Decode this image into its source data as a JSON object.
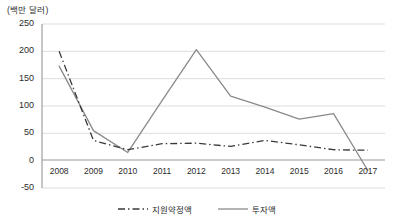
{
  "chart_data": {
    "type": "line",
    "title": "",
    "subtitle": "",
    "unit_label": "(백만 달러)",
    "xlabel": "",
    "ylabel": "",
    "categories": [
      "2008",
      "2009",
      "2010",
      "2011",
      "2012",
      "2013",
      "2014",
      "2015",
      "2016",
      "2017"
    ],
    "x": [
      2008,
      2009,
      2010,
      2011,
      2012,
      2013,
      2014,
      2015,
      2016,
      2017
    ],
    "ylim": [
      -50,
      250
    ],
    "yticks": [
      250,
      200,
      150,
      100,
      50,
      0,
      -50
    ],
    "ytick_labels": [
      "250",
      "200",
      "150",
      "100",
      "50",
      "0",
      "-50"
    ],
    "grid": true,
    "grid_axis": "y",
    "legend_position": "bottom",
    "series": [
      {
        "name": "지원약정액",
        "style": "dash-dot",
        "color": "#3a3a3a",
        "values": [
          200,
          37,
          20,
          31,
          32,
          26,
          37,
          29,
          20,
          19
        ]
      },
      {
        "name": "투자액",
        "style": "solid",
        "color": "#8a8a8a",
        "values": [
          173,
          55,
          15,
          110,
          203,
          118,
          98,
          76,
          86,
          -18
        ]
      }
    ]
  },
  "legend": {
    "items": [
      {
        "label": "지원약정액",
        "icon": "dash-dot-line-swatch"
      },
      {
        "label": "투자액",
        "icon": "solid-line-swatch"
      }
    ]
  },
  "colors": {
    "series_dashdot": "#3a3a3a",
    "series_solid": "#8a8a8a",
    "gridline": "#d9d9d9",
    "axis": "#8c8c8c",
    "zero_axis": "#9a9a9a",
    "text": "#2b2b2b"
  }
}
